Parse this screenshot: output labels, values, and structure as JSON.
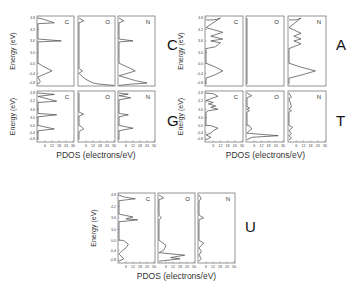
{
  "chart_data": {
    "type": "line",
    "title": "",
    "xlabel": "PDOS (electrons/eV)",
    "ylabel": "Energy (eV)",
    "x_ticks": [
      "6",
      "12",
      "18",
      "24",
      "30"
    ],
    "xlim": [
      0,
      30
    ],
    "y_ticks": [
      "4.8",
      "4.2",
      "3.6",
      "3.0",
      "0.0",
      "-0.4",
      "-0.8"
    ],
    "grid": false,
    "groups": [
      {
        "name": "C",
        "panels": [
          {
            "element": "C",
            "points": [
              [
                0,
                4.8
              ],
              [
                4,
                4.75
              ],
              [
                14,
                4.55
              ],
              [
                0,
                4.5
              ],
              [
                0,
                3.7
              ],
              [
                20,
                3.6
              ],
              [
                0,
                3.55
              ],
              [
                0,
                0.1
              ],
              [
                4,
                -0.1
              ],
              [
                12,
                -0.3
              ],
              [
                5,
                -0.45
              ],
              [
                0,
                -0.55
              ],
              [
                2,
                -0.75
              ],
              [
                0,
                -0.85
              ]
            ]
          },
          {
            "element": "O",
            "points": [
              [
                0,
                4.8
              ],
              [
                4,
                4.65
              ],
              [
                0,
                4.55
              ],
              [
                0,
                -0.2
              ],
              [
                3,
                -0.3
              ],
              [
                0,
                -0.4
              ],
              [
                2,
                -0.5
              ],
              [
                6,
                -0.65
              ],
              [
                12,
                -0.8
              ],
              [
                18,
                -0.85
              ],
              [
                30,
                -0.9
              ]
            ]
          },
          {
            "element": "N",
            "points": [
              [
                0,
                4.8
              ],
              [
                4,
                4.65
              ],
              [
                0,
                4.55
              ],
              [
                0,
                3.7
              ],
              [
                12,
                3.6
              ],
              [
                0,
                3.55
              ],
              [
                0,
                0.1
              ],
              [
                10,
                -0.2
              ],
              [
                14,
                -0.3
              ],
              [
                4,
                -0.45
              ],
              [
                0,
                -0.5
              ],
              [
                14,
                -0.7
              ],
              [
                24,
                -0.8
              ],
              [
                10,
                -0.85
              ],
              [
                0,
                -0.9
              ]
            ]
          }
        ]
      },
      {
        "name": "A",
        "panels": [
          {
            "element": "C",
            "points": [
              [
                0,
                4.7
              ],
              [
                6,
                4.7
              ],
              [
                10,
                4.75
              ],
              [
                12,
                4.8
              ],
              [
                0,
                4.3
              ],
              [
                14,
                4.05
              ],
              [
                4,
                3.85
              ],
              [
                14,
                3.7
              ],
              [
                4,
                3.6
              ],
              [
                12,
                3.5
              ],
              [
                8,
                3.3
              ],
              [
                0,
                3.2
              ],
              [
                0,
                0.1
              ],
              [
                8,
                -0.15
              ],
              [
                14,
                -0.3
              ],
              [
                8,
                -0.45
              ],
              [
                0,
                -0.6
              ],
              [
                0,
                -0.85
              ]
            ]
          },
          {
            "element": "O",
            "points": [
              [
                0,
                4.8
              ],
              [
                0,
                -0.85
              ]
            ]
          },
          {
            "element": "N",
            "points": [
              [
                0,
                4.7
              ],
              [
                6,
                4.7
              ],
              [
                10,
                4.8
              ],
              [
                0,
                4.3
              ],
              [
                10,
                4.0
              ],
              [
                4,
                3.85
              ],
              [
                10,
                3.7
              ],
              [
                4,
                3.6
              ],
              [
                10,
                3.45
              ],
              [
                0,
                3.2
              ],
              [
                0,
                0.1
              ],
              [
                10,
                -0.15
              ],
              [
                22,
                -0.3
              ],
              [
                12,
                -0.45
              ],
              [
                0,
                -0.6
              ],
              [
                0,
                -0.85
              ]
            ]
          }
        ]
      },
      {
        "name": "G",
        "panels": [
          {
            "element": "C",
            "points": [
              [
                0,
                4.8
              ],
              [
                14,
                4.7
              ],
              [
                0,
                4.55
              ],
              [
                16,
                4.2
              ],
              [
                0,
                4.1
              ],
              [
                0,
                3.3
              ],
              [
                16,
                3.2
              ],
              [
                0,
                3.05
              ],
              [
                0,
                0.1
              ],
              [
                14,
                -0.2
              ],
              [
                0,
                -0.3
              ],
              [
                0,
                -0.85
              ]
            ]
          },
          {
            "element": "O",
            "points": [
              [
                0,
                4.8
              ],
              [
                0,
                3.4
              ],
              [
                4,
                3.25
              ],
              [
                0,
                3.1
              ],
              [
                0,
                0.1
              ],
              [
                2,
                -0.05
              ],
              [
                4,
                -0.2
              ],
              [
                0,
                -0.35
              ],
              [
                0,
                -0.85
              ]
            ]
          },
          {
            "element": "N",
            "points": [
              [
                0,
                4.8
              ],
              [
                8,
                4.72
              ],
              [
                0,
                4.6
              ],
              [
                10,
                4.45
              ],
              [
                0,
                4.3
              ],
              [
                0,
                3.3
              ],
              [
                8,
                3.2
              ],
              [
                0,
                3.05
              ],
              [
                0,
                0.1
              ],
              [
                12,
                -0.15
              ],
              [
                0,
                -0.3
              ],
              [
                0,
                -0.85
              ]
            ]
          }
        ]
      },
      {
        "name": "T",
        "panels": [
          {
            "element": "C",
            "points": [
              [
                0,
                4.8
              ],
              [
                6,
                4.75
              ],
              [
                10,
                4.55
              ],
              [
                6,
                4.45
              ],
              [
                0,
                4.25
              ],
              [
                6,
                4.1
              ],
              [
                2,
                4.0
              ],
              [
                8,
                3.85
              ],
              [
                4,
                3.75
              ],
              [
                10,
                3.6
              ],
              [
                2,
                3.5
              ],
              [
                0,
                3.4
              ],
              [
                0,
                0.15
              ],
              [
                4,
                0.0
              ],
              [
                10,
                -0.15
              ],
              [
                6,
                -0.3
              ],
              [
                4,
                -0.45
              ],
              [
                0,
                -0.55
              ],
              [
                4,
                -0.7
              ],
              [
                0,
                -0.85
              ]
            ]
          },
          {
            "element": "O",
            "points": [
              [
                0,
                4.8
              ],
              [
                4,
                4.6
              ],
              [
                0,
                4.45
              ],
              [
                0,
                3.8
              ],
              [
                2,
                3.7
              ],
              [
                0,
                3.6
              ],
              [
                2,
                3.5
              ],
              [
                0,
                3.4
              ],
              [
                0,
                0.1
              ],
              [
                2,
                0.0
              ],
              [
                4,
                -0.2
              ],
              [
                2,
                -0.3
              ],
              [
                0,
                -0.45
              ],
              [
                26,
                -0.6
              ],
              [
                4,
                -0.7
              ],
              [
                0,
                -0.85
              ]
            ]
          },
          {
            "element": "N",
            "points": [
              [
                0,
                4.8
              ],
              [
                2,
                4.5
              ],
              [
                0,
                4.4
              ],
              [
                2,
                3.8
              ],
              [
                0,
                3.6
              ],
              [
                2,
                3.5
              ],
              [
                0,
                3.4
              ],
              [
                0,
                0.1
              ],
              [
                3,
                -0.1
              ],
              [
                0,
                -0.3
              ],
              [
                2,
                -0.5
              ],
              [
                0,
                -0.6
              ],
              [
                2,
                -0.75
              ],
              [
                0,
                -0.85
              ]
            ]
          }
        ]
      },
      {
        "name": "U",
        "panels": [
          {
            "element": "C",
            "points": [
              [
                0,
                4.8
              ],
              [
                4,
                4.7
              ],
              [
                14,
                4.6
              ],
              [
                0,
                4.5
              ],
              [
                0,
                3.8
              ],
              [
                12,
                3.65
              ],
              [
                6,
                3.55
              ],
              [
                16,
                3.5
              ],
              [
                0,
                3.4
              ],
              [
                0,
                0.15
              ],
              [
                4,
                0.0
              ],
              [
                8,
                -0.15
              ],
              [
                6,
                -0.3
              ],
              [
                2,
                -0.45
              ],
              [
                0,
                -0.55
              ],
              [
                4,
                -0.75
              ],
              [
                0,
                -0.85
              ]
            ]
          },
          {
            "element": "O",
            "points": [
              [
                0,
                4.8
              ],
              [
                4,
                4.65
              ],
              [
                0,
                4.55
              ],
              [
                0,
                3.75
              ],
              [
                2,
                3.6
              ],
              [
                0,
                3.5
              ],
              [
                0,
                0.1
              ],
              [
                2,
                -0.05
              ],
              [
                6,
                -0.2
              ],
              [
                4,
                -0.4
              ],
              [
                0,
                -0.5
              ],
              [
                22,
                -0.6
              ],
              [
                10,
                -0.7
              ],
              [
                18,
                -0.75
              ],
              [
                0,
                -0.85
              ]
            ]
          },
          {
            "element": "N",
            "points": [
              [
                0,
                4.8
              ],
              [
                2,
                4.6
              ],
              [
                0,
                4.5
              ],
              [
                0,
                3.75
              ],
              [
                4,
                3.6
              ],
              [
                0,
                3.5
              ],
              [
                0,
                0.1
              ],
              [
                4,
                -0.1
              ],
              [
                0,
                -0.3
              ],
              [
                2,
                -0.45
              ],
              [
                0,
                -0.6
              ],
              [
                2,
                -0.75
              ],
              [
                0,
                -0.85
              ]
            ]
          }
        ]
      }
    ],
    "annotations": [
      "C",
      "A",
      "G",
      "T",
      "U"
    ]
  },
  "labels": {
    "xlabel": "PDOS (electrons/eV)",
    "ylabel": "Energy (eV)",
    "group_C": "C",
    "group_A": "A",
    "group_G": "G",
    "group_T": "T",
    "group_U": "U",
    "elem_C": "C",
    "elem_O": "O",
    "elem_N": "N"
  }
}
